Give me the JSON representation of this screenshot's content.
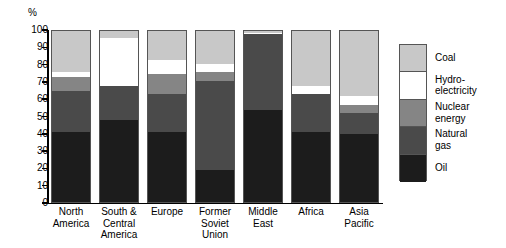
{
  "chart_data": {
    "type": "bar",
    "subtype": "stacked-100-percent",
    "title": "",
    "xlabel": "",
    "ylabel": "%",
    "ylim": [
      0,
      100
    ],
    "yticks": [
      0,
      10,
      20,
      30,
      40,
      50,
      60,
      70,
      80,
      90,
      100
    ],
    "ytick_labels": [
      "0",
      "10",
      "20",
      "30",
      "40",
      "50",
      "60",
      "70",
      "80",
      "90",
      "100"
    ],
    "grid": false,
    "legend_position": "right",
    "categories": [
      "North America",
      "South & Central America",
      "Europe",
      "Former Soviet Union",
      "Middle East",
      "Africa",
      "Asia Pacific"
    ],
    "category_label_lines": [
      [
        "North",
        "America"
      ],
      [
        "South &",
        "Central",
        "America"
      ],
      [
        "Europe"
      ],
      [
        "Former",
        "Soviet",
        "Union"
      ],
      [
        "Middle",
        "East"
      ],
      [
        "Africa"
      ],
      [
        "Asia",
        "Pacific"
      ]
    ],
    "series": [
      {
        "name": "Oil",
        "color": "#1c1c1c",
        "values": [
          41,
          48,
          41,
          19,
          54,
          41,
          40
        ]
      },
      {
        "name": "Natural gas",
        "color": "#4a4a4a",
        "values": [
          24,
          20,
          22,
          52,
          44,
          22,
          12
        ]
      },
      {
        "name": "Nuclear energy",
        "color": "#858585",
        "values": [
          8,
          0,
          12,
          5,
          0,
          0,
          5
        ]
      },
      {
        "name": "Hydro-electricity",
        "color": "#ffffff",
        "values": [
          3,
          28,
          8,
          5,
          1,
          5,
          5
        ]
      },
      {
        "name": "Coal",
        "color": "#c8c8c8",
        "values": [
          24,
          4,
          17,
          19,
          1,
          32,
          38
        ]
      }
    ],
    "legend_entries": [
      {
        "label": "Coal",
        "color": "#c8c8c8"
      },
      {
        "label": "Hydro-electricity",
        "color": "#ffffff"
      },
      {
        "label": "Nuclear energy",
        "color": "#858585"
      },
      {
        "label": "Natural gas",
        "color": "#4a4a4a"
      },
      {
        "label": "Oil",
        "color": "#1c1c1c"
      }
    ],
    "legend_label_lines": [
      [
        "Coal"
      ],
      [
        "Hydro-",
        "electricity"
      ],
      [
        "Nuclear",
        "energy"
      ],
      [
        "Natural",
        "gas"
      ],
      [
        "Oil"
      ]
    ]
  }
}
